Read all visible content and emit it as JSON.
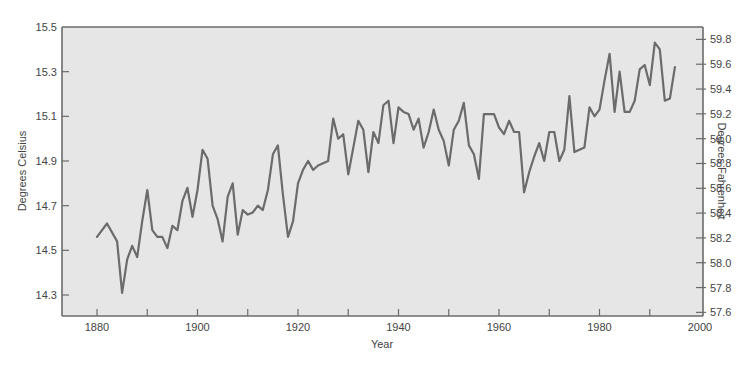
{
  "chart_data": {
    "type": "line",
    "title": "",
    "xlabel": "Year",
    "ylabel": "Degrees Celsius",
    "ylabel_right": "Degrees Fahrenheit",
    "xlim": [
      1873,
      2000
    ],
    "ylim": [
      14.2,
      15.5
    ],
    "ylim_right": [
      57.6,
      59.9
    ],
    "grid": false,
    "legend": null,
    "x_ticks": [
      1880,
      1900,
      1920,
      1940,
      1960,
      1980,
      2000
    ],
    "x_minor_ticks": [
      1890,
      1910,
      1930,
      1950,
      1970,
      1990
    ],
    "y_ticks": [
      14.3,
      14.5,
      14.7,
      14.9,
      15.1,
      15.3,
      15.5
    ],
    "y_tick_labels": [
      "14.3",
      "14.5",
      "14.7",
      "14.9",
      "15.1",
      "15.3",
      "15.5"
    ],
    "y_right_ticks": [
      57.6,
      57.8,
      58.0,
      58.2,
      58.4,
      58.6,
      58.8,
      59.0,
      59.2,
      59.4,
      59.6,
      59.8
    ],
    "y_right_tick_labels": [
      "57.6",
      "57.8",
      "58.0",
      "58.2",
      "58.4",
      "58.6",
      "58.8",
      "59.0",
      "59.2",
      "59.4",
      "59.6",
      "59.8"
    ],
    "x_tick_labels": [
      "1880",
      "1900",
      "1920",
      "1940",
      "1960",
      "1980",
      "2000"
    ],
    "series": [
      {
        "name": "Global mean temperature",
        "color": "#6b6b6b",
        "x": [
          1880,
          1882,
          1884,
          1885,
          1886,
          1887,
          1888,
          1889,
          1890,
          1891,
          1892,
          1893,
          1894,
          1895,
          1896,
          1897,
          1898,
          1899,
          1900,
          1901,
          1902,
          1903,
          1904,
          1905,
          1906,
          1907,
          1908,
          1909,
          1910,
          1911,
          1912,
          1913,
          1914,
          1915,
          1916,
          1917,
          1918,
          1919,
          1920,
          1921,
          1922,
          1923,
          1924,
          1925,
          1926,
          1927,
          1928,
          1929,
          1930,
          1931,
          1932,
          1933,
          1934,
          1935,
          1936,
          1937,
          1938,
          1939,
          1940,
          1941,
          1942,
          1943,
          1944,
          1945,
          1946,
          1947,
          1948,
          1949,
          1950,
          1951,
          1952,
          1953,
          1954,
          1955,
          1956,
          1957,
          1958,
          1959,
          1960,
          1961,
          1962,
          1963,
          1964,
          1965,
          1966,
          1967,
          1968,
          1969,
          1970,
          1971,
          1972,
          1973,
          1974,
          1975,
          1976,
          1977,
          1978,
          1979,
          1980,
          1981,
          1982,
          1983,
          1984,
          1985,
          1986,
          1987,
          1988,
          1989,
          1990,
          1991,
          1992,
          1993,
          1994,
          1995
        ],
        "values": [
          14.56,
          14.62,
          14.54,
          14.31,
          14.46,
          14.52,
          14.47,
          14.63,
          14.77,
          14.59,
          14.56,
          14.56,
          14.51,
          14.61,
          14.59,
          14.72,
          14.78,
          14.65,
          14.77,
          14.95,
          14.91,
          14.7,
          14.64,
          14.54,
          14.74,
          14.8,
          14.57,
          14.68,
          14.66,
          14.67,
          14.7,
          14.68,
          14.77,
          14.93,
          14.97,
          14.75,
          14.56,
          14.63,
          14.8,
          14.86,
          14.9,
          14.86,
          14.88,
          14.89,
          14.9,
          15.09,
          15.0,
          15.02,
          14.84,
          14.96,
          15.08,
          15.04,
          14.85,
          15.03,
          14.98,
          15.15,
          15.17,
          14.98,
          15.14,
          15.12,
          15.11,
          15.04,
          15.09,
          14.96,
          15.03,
          15.13,
          15.04,
          14.99,
          14.88,
          15.04,
          15.08,
          15.16,
          14.97,
          14.93,
          14.82,
          15.11,
          15.11,
          15.11,
          15.05,
          15.02,
          15.08,
          15.03,
          15.03,
          14.76,
          14.85,
          14.92,
          14.98,
          14.9,
          15.03,
          15.03,
          14.9,
          14.95,
          15.19,
          14.94,
          14.95,
          14.96,
          15.14,
          15.1,
          15.13,
          15.26,
          15.38,
          15.12,
          15.3,
          15.12,
          15.12,
          15.17,
          15.31,
          15.33,
          15.24,
          15.43,
          15.4,
          15.17,
          15.18,
          15.32
        ]
      }
    ]
  },
  "figure": {
    "plot_background": "#e6e6e6",
    "frame_color": "#6b6b6b",
    "line_color": "#6b6b6b",
    "x_axis_title": "Year",
    "left_axis_title": "Degrees Celsius",
    "right_axis_title": "Degrees Fahrenheit"
  }
}
